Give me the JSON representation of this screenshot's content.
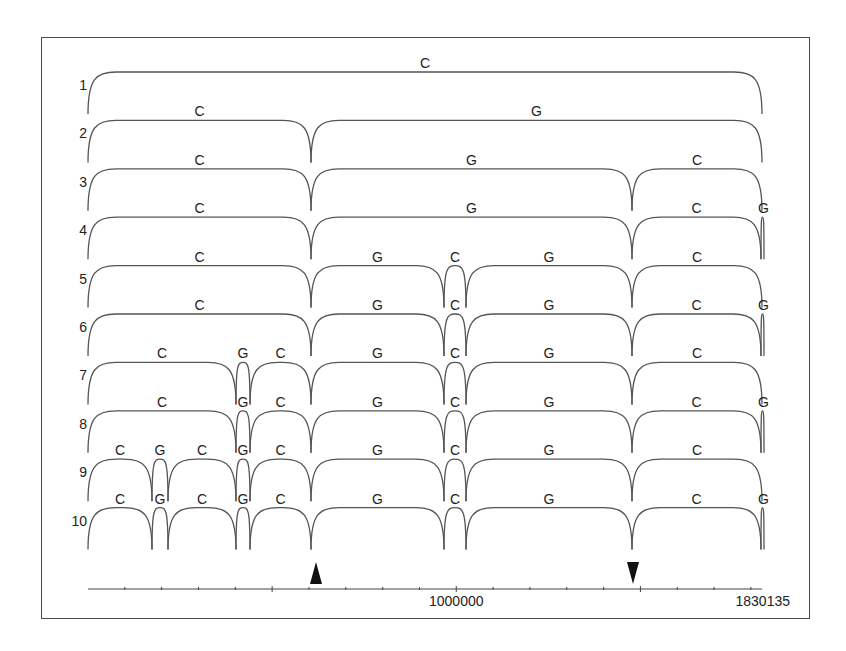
{
  "figure": {
    "frame": {
      "left": 41,
      "top": 37,
      "right": 810,
      "bottom": 619
    },
    "colors": {
      "stroke": "#555555",
      "text": "#222222",
      "arrow": "#111111"
    },
    "row_top_start": 72,
    "row_spacing": 48.4,
    "row_height": 42,
    "axis": {
      "y": 589,
      "x_start": 88,
      "x_end": 762,
      "min": 0,
      "max": 1830135,
      "tick_interval": 100000,
      "labels": [
        {
          "text": "1000000",
          "value": 1000000
        },
        {
          "text": "1830135",
          "value": 1830135
        }
      ]
    },
    "markers": [
      {
        "type": "up-arrow",
        "x": 316,
        "approx_value": 620000
      },
      {
        "type": "down-arrow",
        "x": 633,
        "approx_value": 1480000
      }
    ],
    "rows": [
      {
        "label": "1",
        "segments": [
          {
            "x0": 88,
            "x1": 762,
            "label": "C"
          }
        ]
      },
      {
        "label": "2",
        "segments": [
          {
            "x0": 88,
            "x1": 311,
            "label": "C"
          },
          {
            "x0": 311,
            "x1": 762,
            "label": "G"
          }
        ]
      },
      {
        "label": "3",
        "segments": [
          {
            "x0": 88,
            "x1": 311,
            "label": "C"
          },
          {
            "x0": 311,
            "x1": 632,
            "label": "G"
          },
          {
            "x0": 632,
            "x1": 762,
            "label": "C"
          }
        ]
      },
      {
        "label": "4",
        "segments": [
          {
            "x0": 88,
            "x1": 311,
            "label": "C"
          },
          {
            "x0": 311,
            "x1": 632,
            "label": "G"
          },
          {
            "x0": 632,
            "x1": 761,
            "label": "C"
          },
          {
            "x0": 761,
            "x1": 764,
            "label": "G"
          }
        ]
      },
      {
        "label": "5",
        "segments": [
          {
            "x0": 88,
            "x1": 311,
            "label": "C"
          },
          {
            "x0": 311,
            "x1": 444,
            "label": "G"
          },
          {
            "x0": 444,
            "x1": 466,
            "label": "C"
          },
          {
            "x0": 466,
            "x1": 632,
            "label": "G"
          },
          {
            "x0": 632,
            "x1": 762,
            "label": "C"
          }
        ]
      },
      {
        "label": "6",
        "segments": [
          {
            "x0": 88,
            "x1": 311,
            "label": "C"
          },
          {
            "x0": 311,
            "x1": 444,
            "label": "G"
          },
          {
            "x0": 444,
            "x1": 466,
            "label": "C"
          },
          {
            "x0": 466,
            "x1": 632,
            "label": "G"
          },
          {
            "x0": 632,
            "x1": 761,
            "label": "C"
          },
          {
            "x0": 761,
            "x1": 764,
            "label": "G"
          }
        ]
      },
      {
        "label": "7",
        "segments": [
          {
            "x0": 88,
            "x1": 236,
            "label": "C"
          },
          {
            "x0": 236,
            "x1": 250,
            "label": "G"
          },
          {
            "x0": 250,
            "x1": 311,
            "label": "C"
          },
          {
            "x0": 311,
            "x1": 444,
            "label": "G"
          },
          {
            "x0": 444,
            "x1": 466,
            "label": "C"
          },
          {
            "x0": 466,
            "x1": 632,
            "label": "G"
          },
          {
            "x0": 632,
            "x1": 762,
            "label": "C"
          }
        ]
      },
      {
        "label": "8",
        "segments": [
          {
            "x0": 88,
            "x1": 236,
            "label": "C"
          },
          {
            "x0": 236,
            "x1": 250,
            "label": "G"
          },
          {
            "x0": 250,
            "x1": 311,
            "label": "C"
          },
          {
            "x0": 311,
            "x1": 444,
            "label": "G"
          },
          {
            "x0": 444,
            "x1": 466,
            "label": "C"
          },
          {
            "x0": 466,
            "x1": 632,
            "label": "G"
          },
          {
            "x0": 632,
            "x1": 761,
            "label": "C"
          },
          {
            "x0": 761,
            "x1": 764,
            "label": "G"
          }
        ]
      },
      {
        "label": "9",
        "segments": [
          {
            "x0": 88,
            "x1": 152,
            "label": "C"
          },
          {
            "x0": 152,
            "x1": 168,
            "label": "G"
          },
          {
            "x0": 168,
            "x1": 236,
            "label": "C"
          },
          {
            "x0": 236,
            "x1": 250,
            "label": "G"
          },
          {
            "x0": 250,
            "x1": 311,
            "label": "C"
          },
          {
            "x0": 311,
            "x1": 444,
            "label": "G"
          },
          {
            "x0": 444,
            "x1": 466,
            "label": "C"
          },
          {
            "x0": 466,
            "x1": 632,
            "label": "G"
          },
          {
            "x0": 632,
            "x1": 762,
            "label": "C"
          }
        ]
      },
      {
        "label": "10",
        "segments": [
          {
            "x0": 88,
            "x1": 152,
            "label": "C"
          },
          {
            "x0": 152,
            "x1": 168,
            "label": "G"
          },
          {
            "x0": 168,
            "x1": 236,
            "label": "C"
          },
          {
            "x0": 236,
            "x1": 250,
            "label": "G"
          },
          {
            "x0": 250,
            "x1": 311,
            "label": "C"
          },
          {
            "x0": 311,
            "x1": 444,
            "label": "G"
          },
          {
            "x0": 444,
            "x1": 466,
            "label": "C"
          },
          {
            "x0": 466,
            "x1": 632,
            "label": "G"
          },
          {
            "x0": 632,
            "x1": 761,
            "label": "C"
          },
          {
            "x0": 761,
            "x1": 764,
            "label": "G"
          }
        ]
      }
    ]
  }
}
